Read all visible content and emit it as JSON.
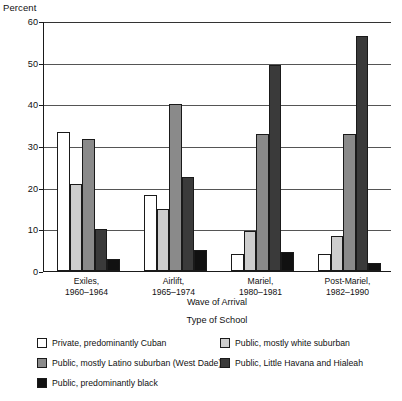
{
  "chart_data": {
    "type": "bar",
    "title": "",
    "subtitle": "",
    "ylabel": "Percent",
    "xlabel": "Wave of Arrival",
    "legend_title": "Type of School",
    "legend_position": "bottom",
    "grid": true,
    "ylim": [
      0,
      60
    ],
    "yticks": [
      0,
      10,
      20,
      30,
      40,
      50,
      60
    ],
    "ytick_labels": [
      "0",
      "10",
      "20",
      "30",
      "40",
      "50",
      "60"
    ],
    "categories": [
      "Exiles, 1960–1964",
      "Airlift, 1965–1974",
      "Mariel, 1980–1981",
      "Post-Mariel, 1982–1990"
    ],
    "category_lines": [
      {
        "line1": "Exiles,",
        "line2": "1960–1964"
      },
      {
        "line1": "Airlift,",
        "line2": "1965–1974"
      },
      {
        "line1": "Mariel,",
        "line2": "1980–1981"
      },
      {
        "line1": "Post-Mariel,",
        "line2": "1982–1990"
      }
    ],
    "series": [
      {
        "name": "Private, predominantly Cuban",
        "color": "#ffffff",
        "values": [
          33.3,
          18.2,
          4.0,
          4.0
        ]
      },
      {
        "name": "Public, mostly white suburban",
        "color": "#cdcdcd",
        "values": [
          21.0,
          15.0,
          9.5,
          8.5
        ]
      },
      {
        "name": "Public, mostly Latino suburban (West Dade)",
        "color": "#8a8a8a",
        "values": [
          31.7,
          40.0,
          33.0,
          33.0
        ]
      },
      {
        "name": "Public, Little Havana and Hialeah",
        "color": "#3a3a3a",
        "values": [
          10.0,
          22.5,
          49.5,
          56.5
        ]
      },
      {
        "name": "Public, predominantly black",
        "color": "#111111",
        "values": [
          2.8,
          5.0,
          4.5,
          2.0
        ]
      }
    ]
  },
  "legend": {
    "items": [
      {
        "label": "Private, predominantly Cuban",
        "color": "#ffffff",
        "col": 0,
        "row": 0
      },
      {
        "label": "Public, mostly white suburban",
        "color": "#cdcdcd",
        "col": 1,
        "row": 0
      },
      {
        "label": "Public, mostly Latino suburban (West Dade)",
        "color": "#8a8a8a",
        "col": 0,
        "row": 1
      },
      {
        "label": "Public, Little Havana and Hialeah",
        "color": "#3a3a3a",
        "col": 1,
        "row": 1
      },
      {
        "label": "Public, predominantly black",
        "color": "#111111",
        "col": 0,
        "row": 2
      }
    ]
  }
}
